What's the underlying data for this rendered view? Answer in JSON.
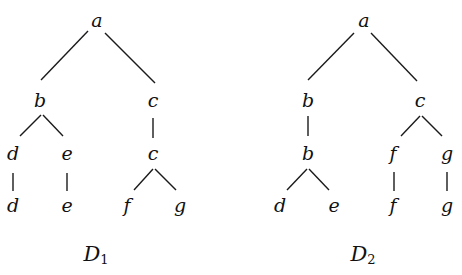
{
  "diagram": {
    "trees": [
      {
        "id": "D1",
        "label": "D",
        "label_sub": "1",
        "label_pos": [
          96,
          255
        ],
        "nodes": [
          {
            "id": "n1",
            "text": "a",
            "x": 97,
            "y": 20
          },
          {
            "id": "n2",
            "text": "b",
            "x": 40,
            "y": 100
          },
          {
            "id": "n3",
            "text": "c",
            "x": 153,
            "y": 100
          },
          {
            "id": "n4",
            "text": "d",
            "x": 13,
            "y": 153
          },
          {
            "id": "n5",
            "text": "e",
            "x": 67,
            "y": 153
          },
          {
            "id": "n6",
            "text": "c",
            "x": 153,
            "y": 153
          },
          {
            "id": "n7",
            "text": "d",
            "x": 13,
            "y": 205
          },
          {
            "id": "n8",
            "text": "e",
            "x": 67,
            "y": 205
          },
          {
            "id": "n9",
            "text": "f",
            "x": 127,
            "y": 205
          },
          {
            "id": "n10",
            "text": "g",
            "x": 180,
            "y": 205
          }
        ],
        "edges": [
          [
            88,
            31,
            41,
            80
          ],
          [
            105,
            33,
            155,
            83
          ],
          [
            41,
            115,
            20,
            136
          ],
          [
            43,
            115,
            63,
            136
          ],
          [
            153,
            118,
            153,
            138
          ],
          [
            13,
            173,
            13,
            191
          ],
          [
            67,
            173,
            67,
            191
          ],
          [
            153,
            169,
            134,
            190
          ],
          [
            155,
            169,
            176,
            190
          ]
        ]
      },
      {
        "id": "D2",
        "label": "D",
        "label_sub": "2",
        "label_pos": [
          363,
          255
        ],
        "nodes": [
          {
            "id": "m1",
            "text": "a",
            "x": 364,
            "y": 20
          },
          {
            "id": "m2",
            "text": "b",
            "x": 308,
            "y": 100
          },
          {
            "id": "m3",
            "text": "c",
            "x": 420,
            "y": 100
          },
          {
            "id": "m4",
            "text": "b",
            "x": 308,
            "y": 153
          },
          {
            "id": "m5",
            "text": "f",
            "x": 393,
            "y": 153
          },
          {
            "id": "m6",
            "text": "g",
            "x": 447,
            "y": 153
          },
          {
            "id": "m7",
            "text": "d",
            "x": 280,
            "y": 205
          },
          {
            "id": "m8",
            "text": "e",
            "x": 334,
            "y": 205
          },
          {
            "id": "m9",
            "text": "f",
            "x": 393,
            "y": 205
          },
          {
            "id": "m10",
            "text": "g",
            "x": 447,
            "y": 205
          }
        ],
        "edges": [
          [
            354,
            33,
            308,
            80
          ],
          [
            371,
            33,
            417,
            81
          ],
          [
            308,
            116,
            308,
            136
          ],
          [
            420,
            116,
            401,
            136
          ],
          [
            422,
            116,
            442,
            136
          ],
          [
            307,
            169,
            287,
            190
          ],
          [
            309,
            169,
            329,
            190
          ],
          [
            394,
            172,
            394,
            191
          ],
          [
            447,
            172,
            447,
            191
          ]
        ]
      }
    ]
  }
}
